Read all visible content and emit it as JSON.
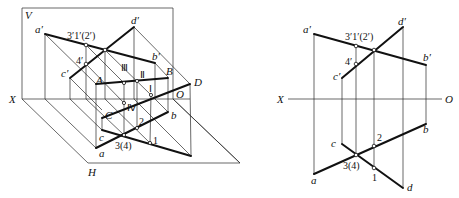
{
  "figure": {
    "left": {
      "title": "axonometric view of two crossing lines AB and CD with V and H projection planes",
      "planes": {
        "v_label": "V",
        "h_label": "H",
        "axis_x_label": "X",
        "axis_o_label": "O"
      },
      "space_points": {
        "A": "A",
        "B": "B",
        "C": "C",
        "D": "D"
      },
      "v_projections": {
        "a1": "a′",
        "b1": "b′",
        "c1": "c′",
        "d1": "d′"
      },
      "h_projections": {
        "a": "a",
        "b": "b",
        "c": "c",
        "d": "d"
      },
      "coincident_labels": {
        "v_top": "3′1′(2′)",
        "v_4": "4′",
        "h_bottom": "3(4)",
        "h_2": "2",
        "h_1": "1"
      },
      "roman_points": {
        "p1": "Ⅰ",
        "p2": "Ⅱ",
        "p3": "Ⅲ",
        "p4": "Ⅳ"
      }
    },
    "right": {
      "title": "orthographic projection of crossing lines",
      "axis_x_label": "X",
      "axis_o_label": "O",
      "v_projections": {
        "a1": "a′",
        "b1": "b′",
        "c1": "c′",
        "d1": "d′"
      },
      "h_projections": {
        "a": "a",
        "b": "b",
        "c": "c",
        "d": "d"
      },
      "coincident_labels": {
        "v_top": "3′1′(2′)",
        "v_4": "4′",
        "h_bottom": "3(4)",
        "h_2": "2",
        "h_1": "1"
      }
    }
  }
}
